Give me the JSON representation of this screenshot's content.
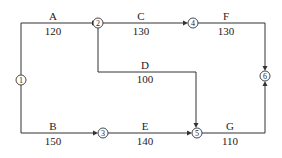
{
  "diagram": {
    "type": "activity-on-arrow network",
    "nodes": [
      {
        "id": "1",
        "label": "①",
        "x": 21,
        "y": 80
      },
      {
        "id": "2",
        "label": "②",
        "x": 98,
        "y": 23
      },
      {
        "id": "3",
        "label": "③",
        "x": 103,
        "y": 133
      },
      {
        "id": "4",
        "label": "④",
        "x": 193,
        "y": 23
      },
      {
        "id": "5",
        "label": "⑤",
        "x": 197,
        "y": 133
      },
      {
        "id": "6",
        "label": "⑥",
        "x": 265,
        "y": 76
      }
    ],
    "activities": [
      {
        "name": "A",
        "duration": "120",
        "from": "1",
        "to": "2"
      },
      {
        "name": "B",
        "duration": "150",
        "from": "1",
        "to": "3"
      },
      {
        "name": "C",
        "duration": "130",
        "from": "2",
        "to": "4"
      },
      {
        "name": "D",
        "duration": "100",
        "from": "2",
        "to": "5"
      },
      {
        "name": "E",
        "duration": "140",
        "from": "3",
        "to": "5"
      },
      {
        "name": "F",
        "duration": "130",
        "from": "4",
        "to": "6"
      },
      {
        "name": "G",
        "duration": "110",
        "from": "5",
        "to": "6"
      }
    ]
  }
}
